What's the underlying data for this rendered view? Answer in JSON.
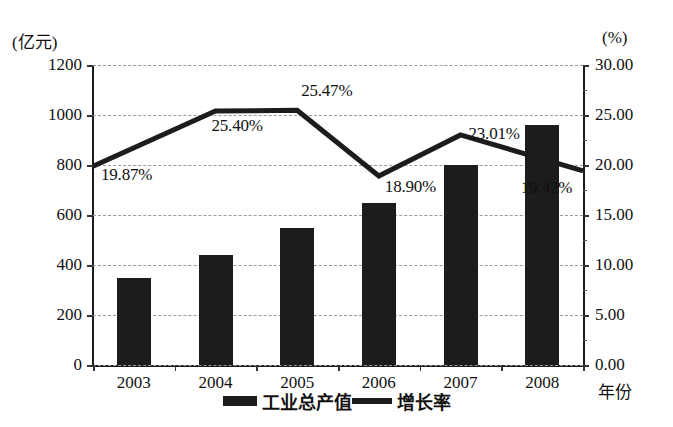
{
  "axis": {
    "left_unit": "(亿元)",
    "right_unit": "(%)",
    "x_title": "年份"
  },
  "legend": {
    "items": [
      {
        "label": "工业总产值",
        "marker": "bar-swatch"
      },
      {
        "label": "增长率",
        "marker": "line-swatch"
      }
    ]
  },
  "chart_data": {
    "type": "bar",
    "title": "",
    "subtitle": "",
    "xlabel": "年份",
    "ylabel": "(亿元)",
    "y2label": "(%)",
    "categories": [
      "2003",
      "2004",
      "2005",
      "2006",
      "2007",
      "2008"
    ],
    "grid": true,
    "legend_position": "bottom-center",
    "ylim": [
      0,
      1200
    ],
    "yticks": [
      0,
      200,
      400,
      600,
      800,
      1000,
      1200
    ],
    "ytick_labels": [
      "0",
      "200",
      "400",
      "600",
      "800",
      "1000",
      "1200"
    ],
    "y2lim": [
      0,
      30
    ],
    "y2ticks": [
      0,
      5,
      10,
      15,
      20,
      25,
      30
    ],
    "y2tick_labels": [
      "0.00",
      "5.00",
      "10.00",
      "15.00",
      "20.00",
      "25.00",
      "30.00"
    ],
    "series": [
      {
        "name": "工业总产值",
        "type": "bar",
        "axis": "left",
        "unit": "亿元",
        "values": [
          350,
          440,
          550,
          650,
          800,
          960
        ],
        "color": "#1c1c1c"
      },
      {
        "name": "增长率",
        "type": "line",
        "axis": "right",
        "unit": "%",
        "values": [
          19.87,
          25.4,
          25.47,
          18.9,
          23.01,
          19.42
        ],
        "color": "#1c1c1c",
        "data_labels": [
          "19.87%",
          "25.40%",
          "25.47%",
          "18.90%",
          "23.01%",
          "19.42%"
        ]
      }
    ]
  }
}
